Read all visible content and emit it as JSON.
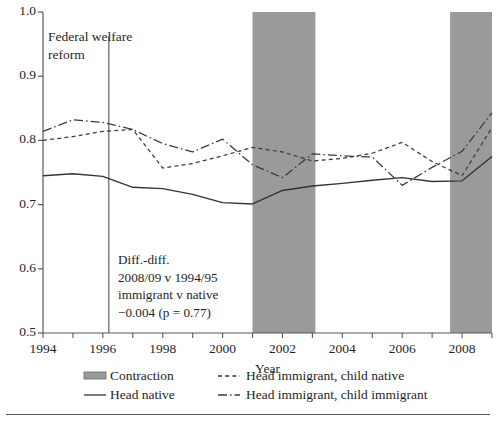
{
  "figure": {
    "background_color": "#ffffff",
    "bottom_rule": true
  },
  "chart_data": {
    "type": "line",
    "title": "",
    "xlabel": "Year",
    "ylabel": "",
    "xlim": [
      1994,
      2009
    ],
    "ylim": [
      0.5,
      1.0
    ],
    "grid": false,
    "legend_position": "bottom",
    "xticks": [
      1994,
      1996,
      1998,
      2000,
      2002,
      2004,
      2006,
      2008
    ],
    "xtick_labels": [
      "1994",
      "1996",
      "1998",
      "2000",
      "2002",
      "2004",
      "2006",
      "2008"
    ],
    "minor_xticks": [
      1995,
      1997,
      1999,
      2001,
      2003,
      2005,
      2007,
      2009
    ],
    "yticks": [
      0.5,
      0.6,
      0.7,
      0.8,
      0.9,
      1.0
    ],
    "ytick_labels": [
      "0.5",
      "0.6",
      "0.7",
      "0.8",
      "0.9",
      "1.0"
    ],
    "x": [
      1994,
      1995,
      1996,
      1997,
      1998,
      1999,
      2000,
      2001,
      2002,
      2003,
      2004,
      2005,
      2006,
      2007,
      2008,
      2009
    ],
    "series": [
      {
        "name": "Head native",
        "style": "solid",
        "color": "#333333",
        "values": [
          0.745,
          0.748,
          0.744,
          0.727,
          0.725,
          0.716,
          0.703,
          0.701,
          0.722,
          0.729,
          0.733,
          0.738,
          0.742,
          0.736,
          0.737,
          0.775
        ]
      },
      {
        "name": "Head immigrant, child native",
        "style": "dashed",
        "color": "#3a3a3a",
        "values": [
          0.8,
          0.806,
          0.814,
          0.817,
          0.757,
          0.764,
          0.776,
          0.789,
          0.782,
          0.768,
          0.772,
          0.78,
          0.797,
          0.767,
          0.745,
          0.82
        ]
      },
      {
        "name": "Head immigrant, child immigrant",
        "style": "dashdot",
        "color": "#3a3a3a",
        "values": [
          0.814,
          0.832,
          0.828,
          0.817,
          0.795,
          0.782,
          0.802,
          0.762,
          0.742,
          0.779,
          0.776,
          0.774,
          0.73,
          0.758,
          0.783,
          0.843
        ]
      }
    ],
    "shaded_regions": [
      {
        "name": "Contraction",
        "x0": 2001.0,
        "x1": 2003.1,
        "color": "#9a9a9a"
      },
      {
        "name": "Contraction",
        "x0": 2007.6,
        "x1": 2009.0,
        "color": "#9a9a9a"
      }
    ],
    "vlines": [
      {
        "name": "Federal welfare reform",
        "x": 1996.2,
        "color": "#555555"
      }
    ],
    "annotations": [
      {
        "name": "federal-welfare-reform",
        "lines": [
          "Federal welfare",
          "reform"
        ],
        "x": 1996.35,
        "y": 0.975
      },
      {
        "name": "diff-in-diff",
        "lines": [
          "Diff.-diff.",
          "2008/09 v 1994/95",
          "immigrant v native",
          "−0.004 (p = 0.77)"
        ],
        "x": 1997.3,
        "y": 0.605
      }
    ],
    "legend": [
      {
        "key": "contraction",
        "label": "Contraction",
        "marker": "patch",
        "color": "#9a9a9a"
      },
      {
        "key": "head-native",
        "label": "Head native",
        "marker": "solid",
        "color": "#333333"
      },
      {
        "key": "head-immigrant-child-native",
        "label": "Head immigrant, child native",
        "marker": "dashed",
        "color": "#3a3a3a"
      },
      {
        "key": "head-immigrant-child-immigrant",
        "label": "Head immigrant, child immigrant",
        "marker": "dashdot",
        "color": "#3a3a3a"
      }
    ]
  }
}
